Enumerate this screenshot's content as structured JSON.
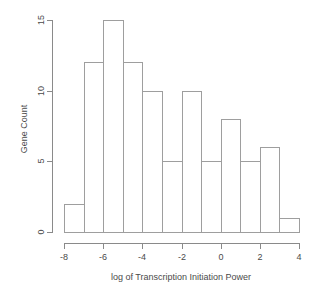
{
  "figure": {
    "background": "#ffffff",
    "line_color": "#8a8a8a",
    "text_color": "#4a4a4a"
  },
  "chart_data": {
    "type": "bar",
    "subtype": "histogram",
    "title": "",
    "xlabel": "log of Transcription Initiation Power",
    "ylabel": "Gene Count",
    "bin_start": -8,
    "bin_width": 1,
    "categories": [
      "-8 to -7",
      "-7 to -6",
      "-6 to -5",
      "-5 to -4",
      "-4 to -3",
      "-3 to -2",
      "-2 to -1",
      "-1 to 0",
      "0 to 1",
      "1 to 2",
      "2 to 3",
      "3 to 4"
    ],
    "values": [
      2,
      12,
      15,
      12,
      10,
      5,
      10,
      5,
      8,
      5,
      6,
      1
    ],
    "xlim": [
      -8,
      4
    ],
    "ylim": [
      0,
      15
    ],
    "x_ticks": [
      -8,
      -6,
      -4,
      -2,
      0,
      2,
      4
    ],
    "y_ticks": [
      0,
      5,
      10,
      15
    ],
    "grid": false,
    "legend": null,
    "bar_fill": "#ffffff",
    "bar_border": "#9e9e9e"
  }
}
